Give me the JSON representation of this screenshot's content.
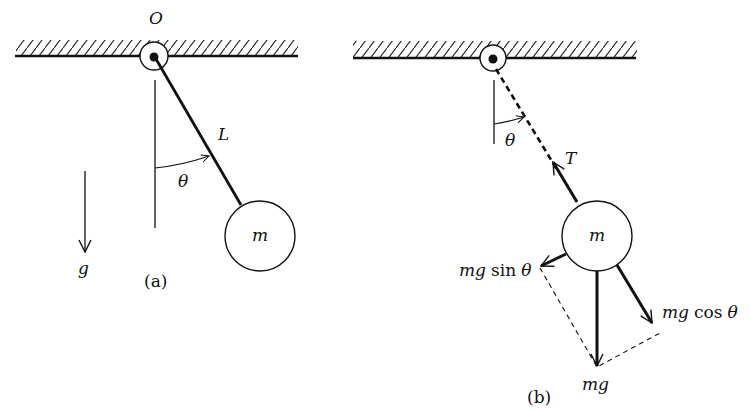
{
  "figure": {
    "colors": {
      "ink": "#111111",
      "background": "#ffffff"
    },
    "panel_a": {
      "caption": "(a)",
      "pivot_label": "O",
      "length_label": "L",
      "angle_label": "θ",
      "mass_label": "m",
      "gravity_label": "g"
    },
    "panel_b": {
      "caption": "(b)",
      "angle_label": "θ",
      "tension_label": "T",
      "mass_label": "m",
      "force_sin": {
        "mg": "mg",
        "fn": "sin",
        "theta": "θ"
      },
      "force_cos": {
        "mg": "mg",
        "fn": "cos",
        "theta": "θ"
      },
      "force_weight": "mg"
    }
  }
}
